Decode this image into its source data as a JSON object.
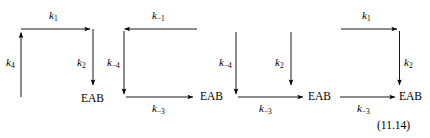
{
  "figure": {
    "equation_number": "(11.14)",
    "species_label": "EAB",
    "schemes": [
      {
        "name": "scheme-1",
        "labels": {
          "top_arrow": "k",
          "top_arrow_sub": "1",
          "left_arrow": "k",
          "left_arrow_sub": "4",
          "right_arrow": "k",
          "right_arrow_sub": "2",
          "product": "EAB"
        }
      },
      {
        "name": "scheme-2",
        "labels": {
          "top_arrow": "k",
          "top_arrow_sub": "−1",
          "left_arrow": "k",
          "left_arrow_sub": "−4",
          "bottom_arrow": "k",
          "bottom_arrow_sub": "−3",
          "product": "EAB"
        }
      },
      {
        "name": "scheme-3",
        "labels": {
          "left_arrow": "k",
          "left_arrow_sub": "−4",
          "middle_arrow": "k",
          "middle_arrow_sub": "2",
          "bottom_arrow": "k",
          "bottom_arrow_sub": "−3",
          "product": "EAB"
        }
      },
      {
        "name": "scheme-4",
        "labels": {
          "top_arrow": "k",
          "top_arrow_sub": "1",
          "right_arrow": "k",
          "right_arrow_sub": "2",
          "bottom_arrow": "k",
          "bottom_arrow_sub": "−3",
          "product": "EAB"
        }
      }
    ]
  },
  "style": {
    "ink": "#000000",
    "background": "#ffffff"
  }
}
